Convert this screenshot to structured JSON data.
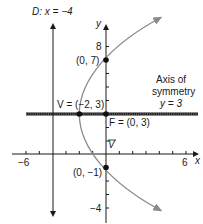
{
  "figure": {
    "type": "parabola",
    "equation": "(y - 3)^2 = 8(x + 2)",
    "colors": {
      "axes": "#1a1a1a",
      "curve": "#8a8a8a",
      "axis_of_symmetry": "#1a1a1a",
      "points": "#111111"
    }
  },
  "labels": {
    "directrix": "D: x = −4",
    "y_axis": "y",
    "x_axis": "x",
    "tick_y_8": "8",
    "tick_y_neg4": "−4",
    "tick_x_neg6": "−6",
    "tick_x_6": "6",
    "point_0_7": "(0, 7)",
    "point_0_neg1": "(0, −1)",
    "vertex": "V = (−2, 3)",
    "focus": "F = (0, 3)",
    "v_marker": "V",
    "axis_sym_line1": "Axis of",
    "axis_sym_line2": "symmetry",
    "axis_sym_line3": "y = 3"
  },
  "points": [
    {
      "name": "vertex",
      "x": -2,
      "y": 3
    },
    {
      "name": "focus",
      "x": 0,
      "y": 3
    },
    {
      "name": "y-intercept-top",
      "x": 0,
      "y": 7
    },
    {
      "name": "y-intercept-bottom",
      "x": 0,
      "y": -1
    }
  ],
  "axes": {
    "xlim": [
      -7,
      7
    ],
    "ylim": [
      -5,
      9
    ],
    "x_ticks_labeled": [
      -6,
      6
    ],
    "y_ticks_labeled": [
      8,
      -4
    ]
  }
}
